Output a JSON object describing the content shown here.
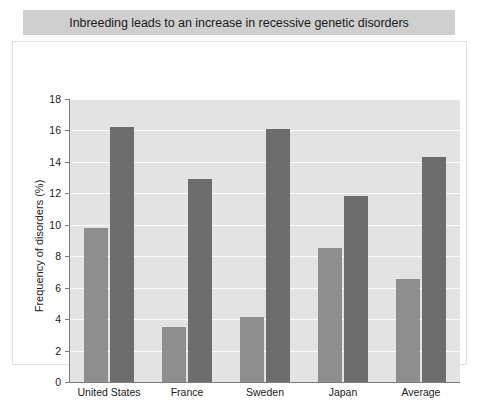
{
  "title": "Inbreeding leads to an increase in recessive genetic disorders",
  "chart_data": {
    "type": "bar",
    "title": "Inbreeding leads to an increase in recessive genetic disorders",
    "xlabel": "",
    "ylabel": "Frequency of disorders (%)",
    "categories": [
      "United States",
      "France",
      "Sweden",
      "Japan",
      "Average"
    ],
    "series": [
      {
        "name": "series-a",
        "values": [
          9.8,
          3.5,
          4.15,
          8.5,
          6.55
        ],
        "color": "#8e8e8e"
      },
      {
        "name": "series-b",
        "values": [
          16.25,
          12.9,
          16.1,
          11.8,
          14.3
        ],
        "color": "#6d6d6d"
      }
    ],
    "ylim": [
      0,
      18
    ],
    "yticks": [
      0,
      2,
      4,
      6,
      8,
      10,
      12,
      14,
      16,
      18
    ],
    "ytick_labels": [
      "0",
      "2",
      "4",
      "6",
      "8",
      "10",
      "12",
      "14",
      "16",
      "18"
    ],
    "grid": true,
    "legend": "none",
    "plot_background": "#e3e3e3",
    "gridline_color": "#fbfbfb",
    "banner_color": "#cfcfcf"
  }
}
